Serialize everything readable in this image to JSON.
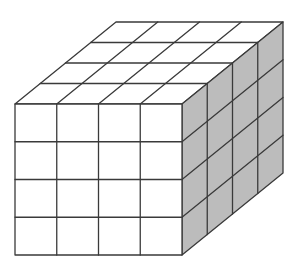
{
  "figure": {
    "type": "rectangular-prism-unit-cubes",
    "dimensions": {
      "width_cubes": 4,
      "height_cubes": 4,
      "depth_cubes": 4
    },
    "front_face": {
      "x0": 15,
      "y0": 104,
      "x1": 182,
      "y1": 255
    },
    "depth_offset": {
      "dx": 101,
      "dy": -82
    },
    "colors": {
      "background": "#ffffff",
      "front_face": "#ffffff",
      "top_face": "#ffffff",
      "side_face": "#bcbcbc",
      "edges": "#3a3a3a"
    }
  }
}
